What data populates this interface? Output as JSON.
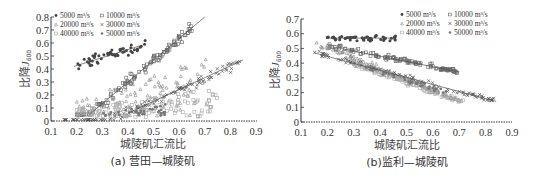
{
  "chart_data": [
    {
      "id": "a",
      "type": "scatter",
      "caption": "(a) 营田—城陵矶",
      "xlabel": "城陵矶汇流比",
      "ylabel": "比降J₀₀₀",
      "ylabel_main": "比降",
      "ylabel_sym": "J",
      "ylabel_sub": "600",
      "xlim": [
        0.1,
        0.9
      ],
      "ylim": [
        0,
        0.8
      ],
      "xticks": [
        "0.1",
        "0.2",
        "0.3",
        "0.4",
        "0.5",
        "0.6",
        "0.7",
        "0.8",
        "0.9"
      ],
      "yticks": [
        "0",
        "0.1",
        "0.2",
        "0.3",
        "0.4",
        "0.5",
        "0.6",
        "0.7",
        "0.8"
      ],
      "grid": false,
      "legend_position": "upper-left",
      "legend": [
        {
          "label": "5000 m³/s",
          "marker": "filled-circle"
        },
        {
          "label": "10000 m³/s",
          "marker": "square"
        },
        {
          "label": "20000 m³/s",
          "marker": "triangle"
        },
        {
          "label": "30000 m³/s",
          "marker": "cross"
        },
        {
          "label": "40000 m³/s",
          "marker": "light-square"
        },
        {
          "label": "50000 m³/s",
          "marker": "star"
        }
      ],
      "series": [
        {
          "name": "5000 m³/s",
          "x_range": [
            0.18,
            0.47
          ],
          "y_range": [
            0.29,
            0.63
          ],
          "trend": [
            [
              0.19,
              0.42
            ],
            [
              0.45,
              0.58
            ]
          ]
        },
        {
          "name": "10000 m³/s",
          "x_range": [
            0.2,
            0.65
          ],
          "y_range": [
            0.05,
            0.76
          ],
          "trend": [
            [
              0.25,
              0.05
            ],
            [
              0.7,
              0.8
            ]
          ]
        },
        {
          "name": "20000 m³/s",
          "x_range": [
            0.2,
            0.72
          ],
          "y_range": [
            0.02,
            0.6
          ]
        },
        {
          "name": "30000 m³/s",
          "x_range": [
            0.15,
            0.84
          ],
          "y_range": [
            0.01,
            0.68
          ],
          "trend": [
            [
              0.4,
              0.06
            ],
            [
              0.85,
              0.47
            ]
          ]
        },
        {
          "name": "40000 m³/s",
          "x_range": [
            0.2,
            0.75
          ],
          "y_range": [
            0.01,
            0.3
          ]
        },
        {
          "name": "50000 m³/s",
          "x_range": [
            0.3,
            0.58
          ],
          "y_range": [
            0.02,
            0.15
          ]
        }
      ]
    },
    {
      "id": "b",
      "type": "scatter",
      "caption": "(b)监利—城陵矶",
      "xlabel": "城陵矶汇流比",
      "ylabel_main": "比降",
      "ylabel_sym": "J",
      "ylabel_sub": "600",
      "xlim": [
        0.1,
        0.9
      ],
      "ylim": [
        0,
        0.7
      ],
      "xticks": [
        "0.1",
        "0.2",
        "0.3",
        "0.4",
        "0.5",
        "0.6",
        "0.7",
        "0.8",
        "0.9"
      ],
      "yticks": [
        "0",
        "0.1",
        "0.2",
        "0.3",
        "0.4",
        "0.5",
        "0.6",
        "0.7"
      ],
      "grid": false,
      "legend_position": "upper-right",
      "legend": [
        {
          "label": "5000 m³/s",
          "marker": "filled-circle"
        },
        {
          "label": "10000 m³/s",
          "marker": "square"
        },
        {
          "label": "20000 m³/s",
          "marker": "triangle"
        },
        {
          "label": "30000 m³/s",
          "marker": "cross"
        },
        {
          "label": "40000 m³/s",
          "marker": "light-square"
        },
        {
          "label": "50000 m³/s",
          "marker": "star"
        }
      ],
      "series": [
        {
          "name": "5000 m³/s",
          "x_range": [
            0.2,
            0.46
          ],
          "y_range": [
            0.54,
            0.63
          ],
          "trend": [
            [
              0.2,
              0.57
            ],
            [
              0.46,
              0.57
            ]
          ]
        },
        {
          "name": "10000 m³/s",
          "x_range": [
            0.2,
            0.7
          ],
          "y_range": [
            0.33,
            0.55
          ],
          "trend": [
            [
              0.25,
              0.5
            ],
            [
              0.7,
              0.34
            ]
          ]
        },
        {
          "name": "20000 m³/s",
          "x_range": [
            0.15,
            0.7
          ],
          "y_range": [
            0.15,
            0.54
          ]
        },
        {
          "name": "30000 m³/s",
          "x_range": [
            0.15,
            0.84
          ],
          "y_range": [
            0.14,
            0.48
          ],
          "trend": [
            [
              0.15,
              0.47
            ],
            [
              0.84,
              0.14
            ]
          ]
        },
        {
          "name": "40000 m³/s",
          "x_range": [
            0.3,
            0.72
          ],
          "y_range": [
            0.13,
            0.4
          ]
        },
        {
          "name": "50000 m³/s",
          "x_range": [
            0.3,
            0.65
          ],
          "y_range": [
            0.2,
            0.4
          ]
        }
      ]
    }
  ]
}
